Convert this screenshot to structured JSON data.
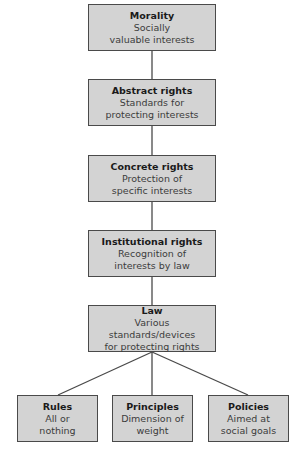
{
  "diagram": {
    "type": "hierarchy",
    "colors": {
      "box_fill": "#d3d3d3",
      "box_border": "#4a4a4a",
      "connector": "#4a4a4a"
    },
    "chain": [
      {
        "title": "Morality",
        "desc": "Socially\nvaluable interests"
      },
      {
        "title": "Abstract rights",
        "desc": "Standards for\nprotecting interests"
      },
      {
        "title": "Concrete rights",
        "desc": "Protection of\nspecific interests"
      },
      {
        "title": "Institutional rights",
        "desc": "Recognition of\ninterests by law"
      },
      {
        "title": "Law",
        "desc": "Various standards/devices\nfor protecting rights"
      }
    ],
    "branches": [
      {
        "title": "Rules",
        "desc": "All or\nnothing"
      },
      {
        "title": "Principles",
        "desc": "Dimension of\nweight"
      },
      {
        "title": "Policies",
        "desc": "Aimed at\nsocial goals"
      }
    ]
  }
}
